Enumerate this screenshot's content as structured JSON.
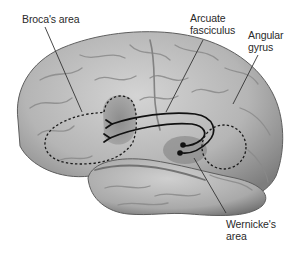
{
  "figure": {
    "colors": {
      "background": "#ffffff",
      "brain_light": "#c9c9c9",
      "brain_mid": "#a8a8a8",
      "brain_dark": "#6e6e6e",
      "broca_shade": "#8a8a8a",
      "wernicke_shade": "#8f8f8f",
      "line": "#1a1a1a",
      "text": "#2a2a2a"
    },
    "labels": [
      {
        "id": "broca",
        "text": "Broca's area",
        "x": 22,
        "y": 13
      },
      {
        "id": "arcuate",
        "text": "Arcuate\nfasciculus",
        "x": 190,
        "y": 12
      },
      {
        "id": "angular",
        "text": "Angular\ngyrus",
        "x": 248,
        "y": 29
      },
      {
        "id": "wernicke",
        "text": "Wernicke's\narea",
        "x": 226,
        "y": 218
      }
    ]
  }
}
